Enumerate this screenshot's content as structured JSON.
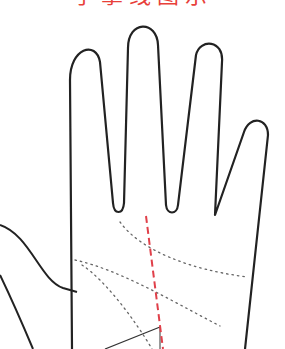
{
  "title": {
    "text": "手掌线图示",
    "color": "#e8403a",
    "cropped": true
  },
  "diagram": {
    "outline_color": "#222222",
    "dotted_line_color": "#666666",
    "axis_line_color": "#e0404a",
    "lines": [
      {
        "name": "heart-line",
        "style": "dotted"
      },
      {
        "name": "head-line",
        "style": "dotted"
      },
      {
        "name": "life-line",
        "style": "dotted"
      },
      {
        "name": "fate-line-marker",
        "style": "dashed-red"
      },
      {
        "name": "measurement-line",
        "style": "solid"
      }
    ]
  }
}
